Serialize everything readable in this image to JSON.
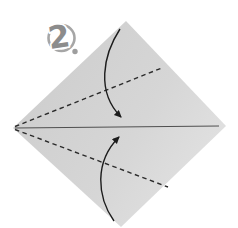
{
  "step_badge": {
    "number": "2"
  },
  "diagram": {
    "kind": "origami-fold-step",
    "paper_shape": "square sheet rotated 45 degrees (diamond)",
    "fold_lines": [
      {
        "name": "upper-valley-fold",
        "style": "dashed",
        "from": "left corner",
        "to": "upper-right edge"
      },
      {
        "name": "lower-valley-fold",
        "style": "dashed",
        "from": "left corner",
        "to": "lower-right edge"
      },
      {
        "name": "center-crease",
        "style": "solid",
        "from": "left corner",
        "to": "right corner"
      }
    ],
    "arrows": [
      {
        "name": "top-fold-arrow",
        "meaning": "fold top corner down to the center crease"
      },
      {
        "name": "bottom-fold-arrow",
        "meaning": "fold bottom corner up to the center crease"
      }
    ]
  },
  "colors": {
    "background": "#ffffff",
    "paper_shade_dark": "#cdcdcd",
    "paper_shade_mid": "#d6d6d6",
    "paper_shade_light": "#e4e4e4",
    "crease_solid": "#4f4f4f",
    "fold_dashed": "#2b2b2b",
    "arrow": "#1c1c1c",
    "badge_ring": "#a6a6a6",
    "badge_number_fill": "#8c8c8c",
    "badge_halo": "#ffffff",
    "badge_dot": "#9e9e9e"
  }
}
